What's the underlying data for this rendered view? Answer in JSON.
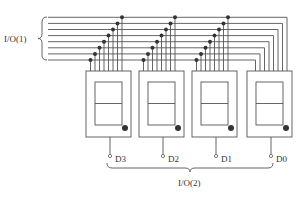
{
  "diagram": {
    "bus_label": "I/O(1)",
    "output_bus_label": "I/O(2)",
    "line_color": "#555555",
    "dot_color": "#333333",
    "bus_line_count": 8,
    "displays": [
      {
        "id": "display-d3",
        "label": "D3"
      },
      {
        "id": "display-d2",
        "label": "D2"
      },
      {
        "id": "display-d1",
        "label": "D1"
      },
      {
        "id": "display-d0",
        "label": "D0"
      }
    ]
  }
}
